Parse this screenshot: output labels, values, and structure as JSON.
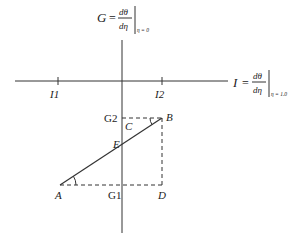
{
  "diagram": {
    "y_axis": {
      "symbol": "G",
      "equals": "=",
      "numerator": "dθ",
      "denominator": "dη",
      "subscript": "η = 0"
    },
    "x_axis": {
      "symbol": "I",
      "equals": "=",
      "numerator": "dθ",
      "denominator": "dη",
      "subscript": "η = 1.0"
    },
    "x_ticks": [
      "I1",
      "I2"
    ],
    "y_ticks": [
      "G2",
      "G1"
    ],
    "points": {
      "A": "A",
      "B": "B",
      "C": "C",
      "D": "D",
      "E": "E"
    },
    "segments": [
      {
        "from": "A",
        "to": "B",
        "style": "solid",
        "note": "line through E"
      },
      {
        "from": "G2",
        "to": "B",
        "style": "dashed"
      },
      {
        "from": "B",
        "to": "D",
        "style": "dashed"
      },
      {
        "from": "A",
        "to": "D",
        "style": "dashed"
      }
    ],
    "angles": [
      "angle at A",
      "angle at B"
    ]
  }
}
